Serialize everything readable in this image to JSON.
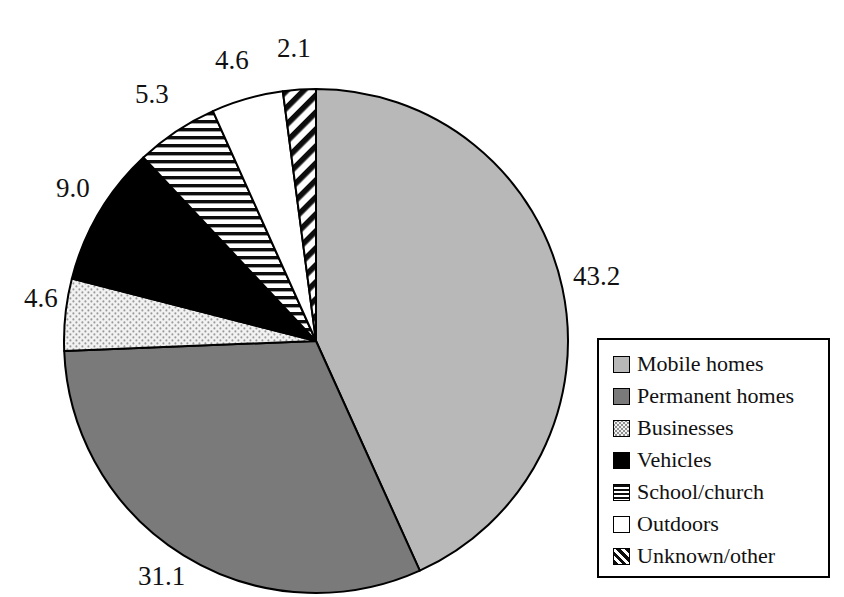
{
  "chart_data": {
    "type": "pie",
    "title": "",
    "subtitle": "",
    "xlabel": "",
    "ylabel": "",
    "grid": false,
    "legend_position": "right",
    "start_angle_deg": 0,
    "direction": "clockwise",
    "units": "percent",
    "categories": [
      "Mobile homes",
      "Permanent homes",
      "Businesses",
      "Vehicles",
      "School/church",
      "Outdoors",
      "Unknown/other"
    ],
    "values": [
      43.2,
      31.1,
      4.6,
      9.0,
      5.3,
      4.6,
      2.1
    ],
    "labels": [
      "43.2",
      "31.1",
      "4.6",
      "9.0",
      "5.3",
      "4.6",
      "2.1"
    ],
    "slices": [
      {
        "name": "Mobile homes",
        "value": 43.2,
        "label": "43.2",
        "fill": "#b8b8b8",
        "pattern": "solid-light-gray",
        "label_x": 573,
        "label_y": 263
      },
      {
        "name": "Permanent homes",
        "value": 31.1,
        "label": "31.1",
        "fill": "#7a7a7a",
        "pattern": "solid-medium-gray",
        "label_x": 138,
        "label_y": 563
      },
      {
        "name": "Businesses",
        "value": 4.6,
        "label": "4.6",
        "fill": "#f0f0f0",
        "pattern": "stipple-dots",
        "label_x": 24,
        "label_y": 285
      },
      {
        "name": "Vehicles",
        "value": 9.0,
        "label": "9.0",
        "fill": "#000000",
        "pattern": "solid-black",
        "label_x": 56,
        "label_y": 175
      },
      {
        "name": "School/church",
        "value": 5.3,
        "label": "5.3",
        "fill": "#ffffff",
        "pattern": "horizontal-lines",
        "label_x": 135,
        "label_y": 81
      },
      {
        "name": "Outdoors",
        "value": 4.6,
        "label": "4.6",
        "fill": "#ffffff",
        "pattern": "none-white",
        "label_x": 215,
        "label_y": 47
      },
      {
        "name": "Unknown/other",
        "value": 2.1,
        "label": "2.1",
        "fill": "#ffffff",
        "pattern": "diagonal-stripes",
        "label_x": 277,
        "label_y": 35
      }
    ],
    "geometry": {
      "center_x": 316,
      "center_y": 341,
      "radius": 252
    }
  },
  "legend": {
    "items": [
      {
        "label": "Mobile homes",
        "pattern": "solid-light-gray"
      },
      {
        "label": "Permanent homes",
        "pattern": "solid-medium-gray"
      },
      {
        "label": "Businesses",
        "pattern": "stipple-dots"
      },
      {
        "label": "Vehicles",
        "pattern": "solid-black"
      },
      {
        "label": "School/church",
        "pattern": "horizontal-lines"
      },
      {
        "label": "Outdoors",
        "pattern": "none-white"
      },
      {
        "label": "Unknown/other",
        "pattern": "diagonal-stripes"
      }
    ]
  },
  "colors": {
    "outline": "#000000",
    "light_gray": "#b8b8b8",
    "medium_gray": "#7a7a7a",
    "stipple_bg": "#f2f2f2",
    "black": "#000000",
    "white": "#ffffff",
    "text": "#111111"
  }
}
